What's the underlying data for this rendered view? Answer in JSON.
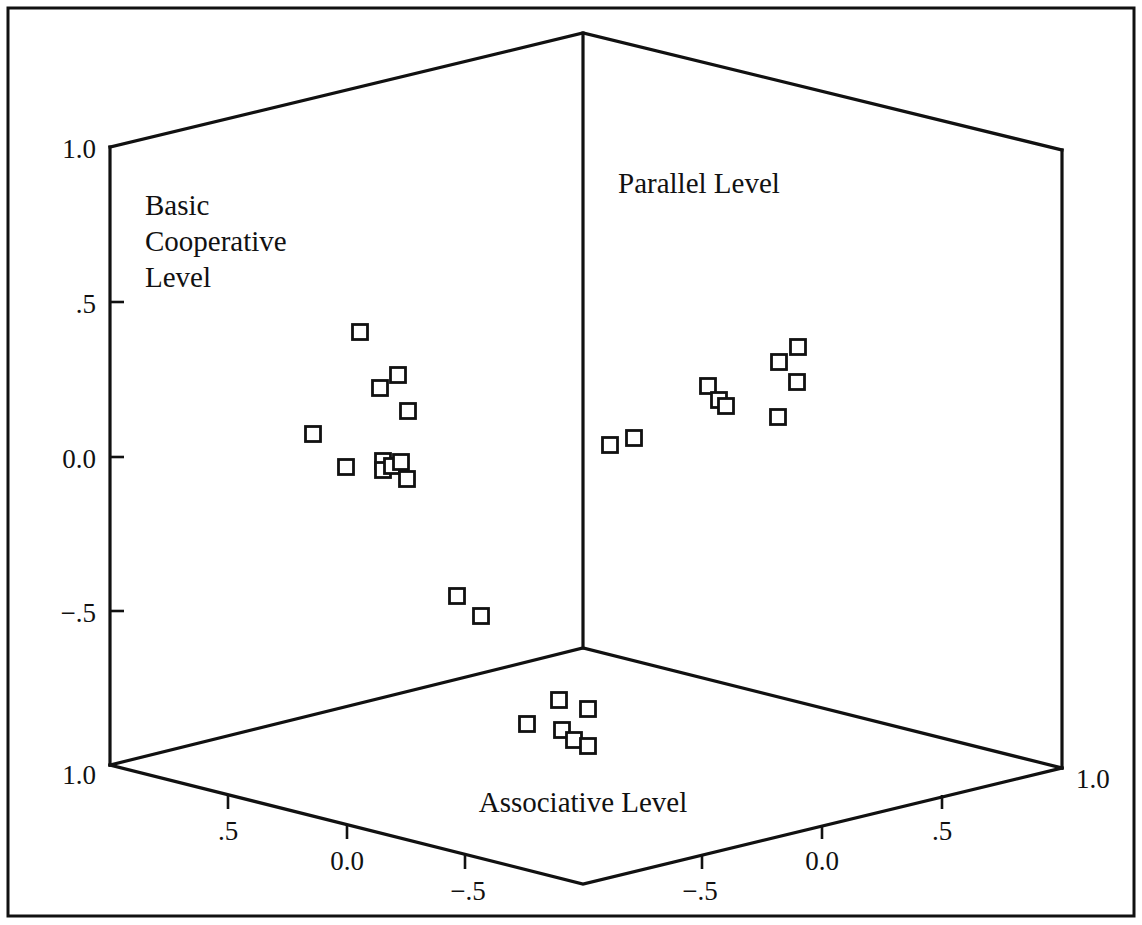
{
  "figure": {
    "background_color": "#ffffff",
    "line_color": "#111111",
    "marker_fill": "#ffffff",
    "width": 1142,
    "height": 925
  },
  "labels": {
    "basic_cooperative_line1": "Basic",
    "basic_cooperative_line2": "Cooperative",
    "basic_cooperative_line3": "Level",
    "parallel_level": "Parallel Level",
    "associative_level": "Associative Level"
  },
  "vertical_axis": {
    "name": "Basic Cooperative Level",
    "ticks": [
      "1.0",
      ".5",
      "0.0",
      "−.5"
    ],
    "tick_values": [
      1.0,
      0.5,
      0.0,
      -0.5
    ],
    "bottom_corner_label": "1.0"
  },
  "left_floor_axis": {
    "name": "Associative Level",
    "ticks": [
      "1.0",
      ".5",
      "0.0",
      "−.5"
    ],
    "tick_values": [
      1.0,
      0.5,
      0.0,
      -0.5
    ]
  },
  "right_floor_axis": {
    "name": "Associative Level",
    "ticks": [
      "−.5",
      "0.0",
      ".5",
      "1.0"
    ],
    "tick_values": [
      -0.5,
      0.0,
      0.5,
      1.0
    ]
  },
  "chart_data": {
    "type": "scatter",
    "title": "",
    "subtitle": "",
    "projection": "3d-box-scatter",
    "xlabel": "Associative Level",
    "ylabel": "Parallel Level",
    "zlabel": "Basic Cooperative Level",
    "axis_labels_visible": [
      "Basic Cooperative Level",
      "Parallel Level",
      "Associative Level"
    ],
    "xlim": [
      -1.0,
      1.0
    ],
    "ylim": [
      -1.0,
      1.0
    ],
    "zlim": [
      -1.0,
      1.0
    ],
    "grid": false,
    "legend": false,
    "marker": "open-square",
    "marker_size": 15,
    "note": "Three 2-D projections of the same 3-D point cloud are drawn onto the three visible faces of the box: the left back wall (Basic Cooperative vs Associative), the right back wall (Basic Cooperative vs Parallel) and the floor (Associative vs Parallel).",
    "panels": [
      {
        "name": "left-back-wall",
        "xlabel": "Associative Level",
        "ylabel": "Basic Cooperative Level",
        "points": [
          {
            "px": 360,
            "py": 332
          },
          {
            "px": 398,
            "py": 375
          },
          {
            "px": 380,
            "py": 388
          },
          {
            "px": 408,
            "py": 411
          },
          {
            "px": 313,
            "py": 434
          },
          {
            "px": 346,
            "py": 467
          },
          {
            "px": 383,
            "py": 461
          },
          {
            "px": 383,
            "py": 470
          },
          {
            "px": 392,
            "py": 466
          },
          {
            "px": 401,
            "py": 462
          },
          {
            "px": 407,
            "py": 479
          },
          {
            "px": 457,
            "py": 596
          },
          {
            "px": 481,
            "py": 616
          }
        ]
      },
      {
        "name": "right-back-wall",
        "xlabel": "Parallel Level",
        "ylabel": "Basic Cooperative Level",
        "points": [
          {
            "px": 610,
            "py": 445
          },
          {
            "px": 634,
            "py": 438
          },
          {
            "px": 708,
            "py": 386
          },
          {
            "px": 719,
            "py": 400
          },
          {
            "px": 726,
            "py": 406
          },
          {
            "px": 779,
            "py": 362
          },
          {
            "px": 798,
            "py": 347
          },
          {
            "px": 797,
            "py": 382
          },
          {
            "px": 778,
            "py": 417
          }
        ]
      },
      {
        "name": "floor",
        "xlabel": "Associative Level",
        "ylabel": "Parallel Level",
        "points": [
          {
            "px": 559,
            "py": 700
          },
          {
            "px": 588,
            "py": 709
          },
          {
            "px": 527,
            "py": 724
          },
          {
            "px": 562,
            "py": 730
          },
          {
            "px": 574,
            "py": 740
          },
          {
            "px": 588,
            "py": 746
          }
        ]
      }
    ]
  },
  "geometry": {
    "frame": {
      "x": 8,
      "y": 8,
      "width": 1126,
      "height": 908
    },
    "box": {
      "top_apex": {
        "x": 583,
        "y": 33
      },
      "top_left": {
        "x": 110,
        "y": 147
      },
      "top_right": {
        "x": 1062,
        "y": 150
      },
      "center": {
        "x": 583,
        "y": 648
      },
      "bottom_left": {
        "x": 110,
        "y": 765
      },
      "bottom_right": {
        "x": 1062,
        "y": 768
      },
      "front_bottom": {
        "x": 583,
        "y": 884
      }
    }
  }
}
